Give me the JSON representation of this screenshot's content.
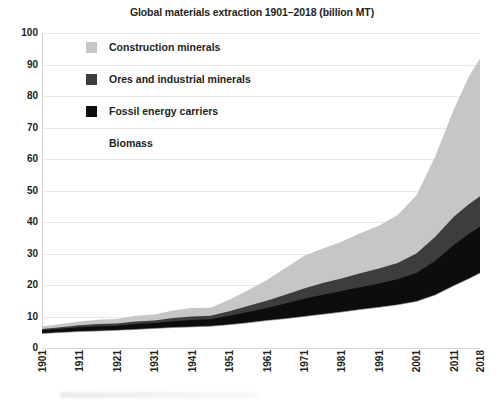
{
  "chart_data": {
    "type": "area",
    "title": "Global materials extraction 1901–2018 (billion MT)",
    "xlabel": "",
    "ylabel": "",
    "ylim": [
      0,
      100
    ],
    "ytick_values": [
      0,
      10,
      20,
      30,
      40,
      50,
      60,
      70,
      80,
      90,
      100
    ],
    "ytick_labels": [
      "0",
      "10",
      "20",
      "30",
      "40",
      "50",
      "60",
      "70",
      "80",
      "90",
      "100"
    ],
    "xtick_labels": [
      "1901",
      "1911",
      "1921",
      "1931",
      "1941",
      "1951",
      "1961",
      "1971",
      "1981",
      "1991",
      "2001",
      "2011",
      "2018"
    ],
    "xtick_values": [
      1901,
      1911,
      1921,
      1931,
      1941,
      1951,
      1961,
      1971,
      1981,
      1991,
      2001,
      2011,
      2018
    ],
    "xlim": [
      1901,
      2018
    ],
    "grid": true,
    "stacked": true,
    "legend_position": "upper-left-inside",
    "x": [
      1901,
      1906,
      1911,
      1916,
      1921,
      1926,
      1931,
      1936,
      1941,
      1946,
      1951,
      1956,
      1961,
      1966,
      1971,
      1976,
      1981,
      1986,
      1991,
      1996,
      2001,
      2006,
      2011,
      2015,
      2018
    ],
    "series": [
      {
        "name": "Biomass",
        "color": "#ffffff",
        "values": [
          4.6,
          4.9,
          5.2,
          5.4,
          5.6,
          5.9,
          6.2,
          6.5,
          6.7,
          6.9,
          7.4,
          8.0,
          8.7,
          9.3,
          10.0,
          10.7,
          11.4,
          12.2,
          12.9,
          13.7,
          14.8,
          16.8,
          19.8,
          22.0,
          23.8
        ]
      },
      {
        "name": "Fossil energy carriers",
        "color": "#0d0d0d",
        "values": [
          1.0,
          1.2,
          1.4,
          1.5,
          1.5,
          1.7,
          1.7,
          2.0,
          2.2,
          2.2,
          2.8,
          3.4,
          4.0,
          4.8,
          5.6,
          6.2,
          6.7,
          7.1,
          7.6,
          8.1,
          9.0,
          10.8,
          12.9,
          14.2,
          14.8
        ]
      },
      {
        "name": "Ores and industrial minerals",
        "color": "#3d3d3d",
        "values": [
          0.4,
          0.5,
          0.6,
          0.7,
          0.7,
          0.8,
          0.8,
          1.0,
          1.1,
          1.1,
          1.5,
          1.9,
          2.3,
          2.8,
          3.3,
          3.7,
          4.0,
          4.4,
          4.7,
          5.2,
          6.2,
          7.6,
          9.0,
          9.4,
          9.6
        ]
      },
      {
        "name": "Construction minerals",
        "color": "#c6c6c6",
        "values": [
          0.8,
          1.0,
          1.2,
          1.4,
          1.4,
          1.8,
          1.9,
          2.4,
          2.7,
          2.6,
          3.6,
          5.0,
          6.5,
          8.5,
          10.3,
          11.0,
          11.6,
          12.7,
          13.6,
          15.2,
          18.4,
          25.5,
          34.0,
          40.5,
          43.7
        ]
      }
    ],
    "totals": [
      6.8,
      7.6,
      8.4,
      9.0,
      9.2,
      10.2,
      10.6,
      11.9,
      12.7,
      12.8,
      15.3,
      18.3,
      21.5,
      25.4,
      29.2,
      31.6,
      33.7,
      36.4,
      38.8,
      42.2,
      48.4,
      60.7,
      75.7,
      86.1,
      91.9
    ]
  },
  "legend": {
    "items": [
      {
        "label": "Construction minerals",
        "color": "#c6c6c6"
      },
      {
        "label": "Ores and industrial minerals",
        "color": "#3d3d3d"
      },
      {
        "label": "Fossil energy carriers",
        "color": "#0d0d0d"
      },
      {
        "label": "Biomass",
        "color": "#ffffff"
      }
    ]
  }
}
